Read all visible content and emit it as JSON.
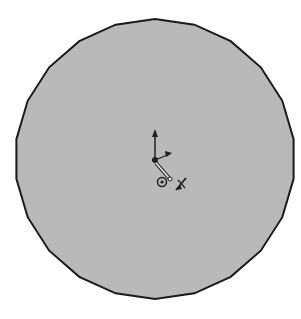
{
  "scene": {
    "background": "#ffffff",
    "shape": {
      "type": "polygonal-circle",
      "center": [
        155,
        159
      ],
      "radius": 140,
      "sides": 22,
      "fill": "#b9b9b9",
      "stroke": "#1a1a1a"
    },
    "origin": {
      "position": [
        155,
        160
      ],
      "arrow_tip": [
        155,
        131
      ],
      "color": "#202020"
    },
    "markers": {
      "sketch_point": [
        162,
        182
      ],
      "relation_glyph": [
        181,
        183
      ]
    }
  },
  "watermark": {
    "text": ""
  }
}
